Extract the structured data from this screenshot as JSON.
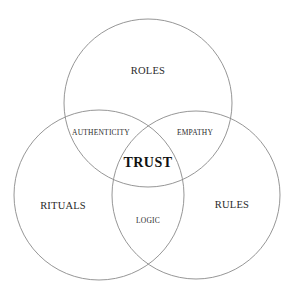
{
  "diagram": {
    "type": "venn",
    "stroke_color": "#8a8a8a",
    "background": "#ffffff",
    "sets": [
      {
        "id": "roles",
        "label": "ROLES",
        "cx": 148,
        "cy": 103,
        "r": 84
      },
      {
        "id": "rituals",
        "label": "RITUALS",
        "cx": 99,
        "cy": 195,
        "r": 85
      },
      {
        "id": "rules",
        "label": "RULES",
        "cx": 196,
        "cy": 195,
        "r": 84
      }
    ],
    "intersections": [
      {
        "id": "roles-rituals",
        "sets": [
          "roles",
          "rituals"
        ],
        "label": "AUTHENTICITY"
      },
      {
        "id": "roles-rules",
        "sets": [
          "roles",
          "rules"
        ],
        "label": "EMPATHY"
      },
      {
        "id": "rituals-rules",
        "sets": [
          "rituals",
          "rules"
        ],
        "label": "LOGIC"
      },
      {
        "id": "all",
        "sets": [
          "roles",
          "rituals",
          "rules"
        ],
        "label": "TRUST"
      }
    ]
  },
  "labels": {
    "roles": "ROLES",
    "rituals": "RITUALS",
    "rules": "RULES",
    "authenticity": "AUTHENTICITY",
    "empathy": "EMPATHY",
    "logic": "LOGIC",
    "trust": "TRUST"
  }
}
